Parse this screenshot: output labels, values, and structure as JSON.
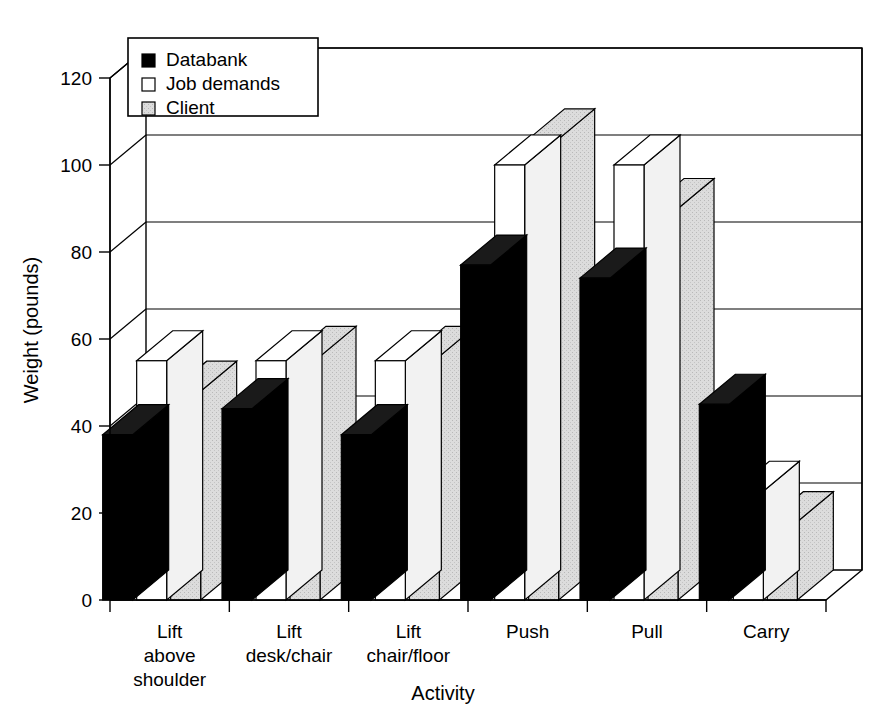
{
  "chart_data": {
    "type": "bar",
    "title": "",
    "subtitle": "",
    "xlabel": "Activity",
    "ylabel": "Weight (pounds)",
    "ylim": [
      0,
      120
    ],
    "ytick_interval": 20,
    "ytick_labels": [
      "0",
      "20",
      "40",
      "60",
      "80",
      "100",
      "120"
    ],
    "yticks": [
      0,
      20,
      40,
      60,
      80,
      100,
      120
    ],
    "grid": true,
    "grid_axis": "y",
    "legend_position": "top-left",
    "style": "3d-grouped-bar",
    "categories": [
      "Lift above shoulder",
      "Lift desk/chair",
      "Lift chair/floor",
      "Push",
      "Pull",
      "Carry"
    ],
    "category_label_lines": [
      [
        "Lift",
        "above",
        "shoulder"
      ],
      [
        "Lift",
        "desk/chair"
      ],
      [
        "Lift",
        "chair/floor"
      ],
      [
        "Push"
      ],
      [
        "Pull"
      ],
      [
        "Carry"
      ]
    ],
    "series": [
      {
        "name": "Databank",
        "color": "#000000",
        "values": [
          38,
          44,
          38,
          77,
          74,
          45
        ]
      },
      {
        "name": "Job demands",
        "color": "#ffffff",
        "values": [
          55,
          55,
          55,
          100,
          100,
          25
        ]
      },
      {
        "name": "Client",
        "color": "#d9d9d9",
        "values": [
          48,
          56,
          56,
          106,
          90,
          18
        ]
      }
    ]
  },
  "legend": {
    "entries": [
      {
        "label": "Databank",
        "swatch": "#000000"
      },
      {
        "label": "Job demands",
        "swatch": "#ffffff"
      },
      {
        "label": "Client",
        "swatch": "#d9d9d9"
      }
    ]
  },
  "axes": {
    "y_title": "Weight (pounds)",
    "x_title": "Activity"
  }
}
